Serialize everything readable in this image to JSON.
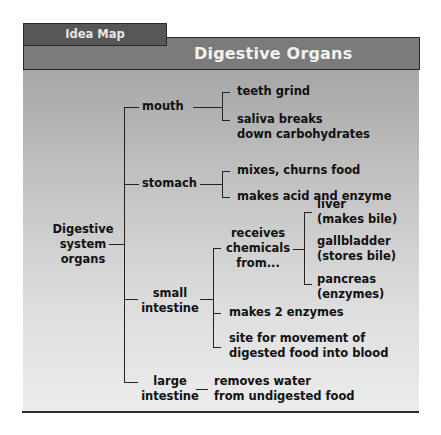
{
  "tab": {
    "label": "Idea Map"
  },
  "header": {
    "title": "Digestive Organs"
  },
  "colors": {
    "tab_bg": "#575757",
    "header_bg": "#7b7b7b",
    "panel_top": "#a7a7a7",
    "panel_bottom": "#ececec",
    "text": "#111111",
    "title_text": "#f2f2f2"
  },
  "map": {
    "root": {
      "line1": "Digestive",
      "line2": "system",
      "line3": "organs"
    },
    "mouth": {
      "label": "mouth",
      "items": [
        {
          "line1": "teeth grind"
        },
        {
          "line1": "saliva breaks",
          "line2": "down carbohydrates"
        }
      ]
    },
    "stomach": {
      "label": "stomach",
      "items": [
        {
          "line1": "mixes, churns food"
        },
        {
          "line1": "makes acid and enzyme"
        }
      ]
    },
    "small_intestine": {
      "line1": "small",
      "line2": "intestine",
      "receives": {
        "line1": "receives",
        "line2": "chemicals",
        "line3": "from...",
        "sources": [
          {
            "line1": "liver",
            "line2": "(makes bile)"
          },
          {
            "line1": "gallbladder",
            "line2": "(stores bile)"
          },
          {
            "line1": "pancreas",
            "line2": "(enzymes)"
          }
        ]
      },
      "items": [
        {
          "line1": "makes 2 enzymes"
        },
        {
          "line1": "site for movement of",
          "line2": "digested food into blood"
        }
      ]
    },
    "large_intestine": {
      "line1": "large",
      "line2": "intestine",
      "items": [
        {
          "line1": "removes water",
          "line2": "from undigested food"
        }
      ]
    }
  }
}
